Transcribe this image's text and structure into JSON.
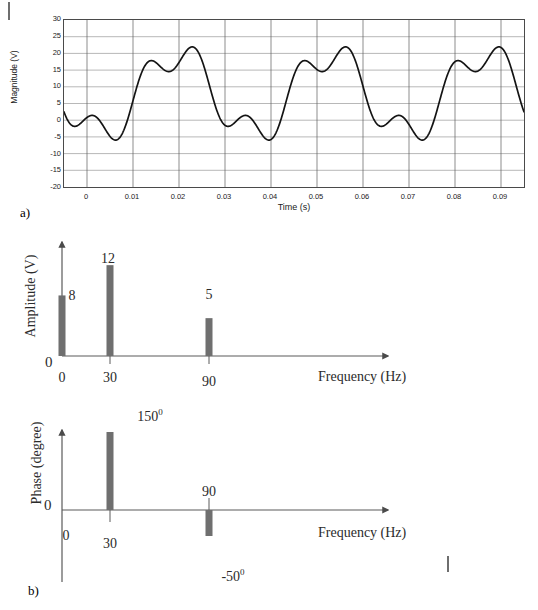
{
  "figure": {
    "caption_a": "a)",
    "caption_b": "b)"
  },
  "chart_data": [
    {
      "id": "time-waveform",
      "type": "line",
      "title": "",
      "xlabel": "Time (s)",
      "ylabel": "Magnitude (V)",
      "xlim": [
        -0.005,
        0.095
      ],
      "ylim": [
        -20,
        30
      ],
      "grid": true,
      "legend": "none",
      "xticks": [
        "0",
        "0.01",
        "0.02",
        "0.03",
        "0.04",
        "0.05",
        "0.06",
        "0.07",
        "0.08",
        "0.09"
      ],
      "xtick_values": [
        0,
        0.01,
        0.02,
        0.03,
        0.04,
        0.05,
        0.06,
        0.07,
        0.08,
        0.09
      ],
      "yticks": [
        "30",
        "25",
        "20",
        "15",
        "10",
        "5",
        "0",
        "-5",
        "-10",
        "-15",
        "-20"
      ],
      "ytick_values": [
        30,
        25,
        20,
        15,
        10,
        5,
        0,
        -5,
        -10,
        -15,
        -20
      ],
      "series": [
        {
          "name": "v(t)",
          "color": "#1a1a1a",
          "description": "Sum of a DC term and two sinusoids given by the amplitude and phase spectra",
          "components": [
            {
              "frequency_hz": 0,
              "amplitude_v": 8,
              "phase_deg": 0
            },
            {
              "frequency_hz": 30,
              "amplitude_v": 12,
              "phase_deg": 150
            },
            {
              "frequency_hz": 90,
              "amplitude_v": 5,
              "phase_deg": -50
            }
          ],
          "notable_points": [
            {
              "t": 0.01,
              "v": 24.5,
              "label": "peak"
            },
            {
              "t": 0.026,
              "v": -14.0,
              "label": "trough"
            },
            {
              "t": 0.043,
              "v": 24.5,
              "label": "peak"
            },
            {
              "t": 0.06,
              "v": -14.0,
              "label": "trough"
            },
            {
              "t": 0.0765,
              "v": 24.5,
              "label": "peak"
            },
            {
              "t": 0.093,
              "v": -14.0,
              "label": "trough"
            }
          ]
        }
      ]
    },
    {
      "id": "amplitude-spectrum",
      "type": "bar",
      "title": "",
      "xlabel": "Frequency (Hz)",
      "ylabel": "Amplitude (V)",
      "origin_label": "0",
      "categories": [
        "0",
        "30",
        "90"
      ],
      "x_values": [
        0,
        30,
        90
      ],
      "values": [
        8,
        12,
        5
      ],
      "value_labels": [
        "8",
        "12",
        "5"
      ],
      "bar_color": "#6f6f6f",
      "axis_color": "#5a5a5a",
      "grid": false,
      "legend": "none",
      "ylim": [
        0,
        14
      ]
    },
    {
      "id": "phase-spectrum",
      "type": "bar",
      "title": "",
      "xlabel": "Frequency (Hz)",
      "ylabel": "Phase (degree)",
      "origin_label": "0",
      "categories": [
        "0",
        "30",
        "90"
      ],
      "x_values": [
        0,
        30,
        90
      ],
      "values": [
        0,
        150,
        -50
      ],
      "value_labels": [
        "150⁰",
        "-50⁰"
      ],
      "value_label_150": "150",
      "value_label_150_sup": "0",
      "value_label_m50": "-50",
      "value_label_m50_sup": "0",
      "bar_color": "#6f6f6f",
      "axis_color": "#5a5a5a",
      "grid": false,
      "legend": "none",
      "ylim": [
        -80,
        180
      ]
    }
  ]
}
